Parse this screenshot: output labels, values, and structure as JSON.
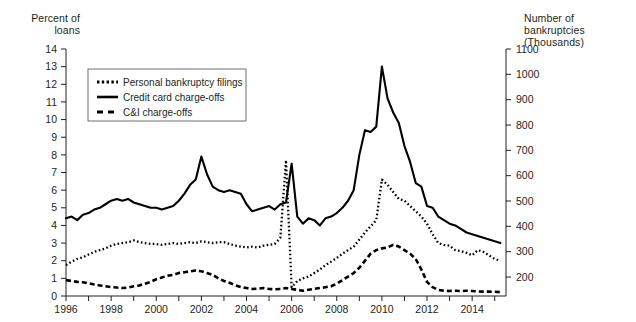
{
  "figure": {
    "left_axis_title": "Percent of\nloans",
    "right_axis_title": "Number of bankruptcies\n(Thousands)",
    "clipped_header": ""
  },
  "legend": {
    "items": [
      {
        "label": "Personal bankruptcy filings",
        "style": "dotted"
      },
      {
        "label": "Credit card charge-offs",
        "style": "solid"
      },
      {
        "label": "C&I charge-offs",
        "style": "dashed"
      }
    ]
  },
  "chart_data": {
    "type": "line",
    "title": "",
    "xlabel": "",
    "ylabel": "Percent of loans",
    "y2label": "Number of bankruptcies (Thousands)",
    "xlim": [
      1996.0,
      2015.5
    ],
    "ylim": [
      0,
      14
    ],
    "y2lim": [
      125,
      1100
    ],
    "grid": false,
    "legend_position": "upper-left-inset",
    "x_ticks": [
      1996,
      1997,
      1998,
      1999,
      2000,
      2001,
      2002,
      2003,
      2004,
      2005,
      2006,
      2007,
      2008,
      2009,
      2010,
      2011,
      2012,
      2013,
      2014,
      2015
    ],
    "x_tick_labels": [
      "1996",
      "",
      "1998",
      "",
      "2000",
      "",
      "2002",
      "",
      "2004",
      "",
      "2006",
      "",
      "2008",
      "",
      "2010",
      "",
      "2012",
      "",
      "2014",
      ""
    ],
    "y_ticks": [
      0,
      1,
      2,
      3,
      4,
      5,
      6,
      7,
      8,
      9,
      10,
      11,
      12,
      13,
      14
    ],
    "y_tick_labels": [
      "0",
      "1",
      "2",
      "3",
      "4",
      "5",
      "6",
      "7",
      "8",
      "9",
      "10",
      "11",
      "12",
      "13",
      "14"
    ],
    "y2_ticks": [
      200,
      300,
      400,
      500,
      600,
      700,
      800,
      900,
      1000,
      1100
    ],
    "y2_tick_labels": [
      "200",
      "300",
      "400",
      "500",
      "600",
      "700",
      "800",
      "900",
      "1000",
      "1100"
    ],
    "series": [
      {
        "name": "Credit card charge-offs",
        "style": "solid",
        "axis": "left",
        "x": [
          1996.0,
          1996.25,
          1996.5,
          1996.75,
          1997.0,
          1997.25,
          1997.5,
          1997.75,
          1998.0,
          1998.25,
          1998.5,
          1998.75,
          1999.0,
          1999.25,
          1999.5,
          1999.75,
          2000.0,
          2000.25,
          2000.5,
          2000.75,
          2001.0,
          2001.25,
          2001.5,
          2001.75,
          2002.0,
          2002.25,
          2002.5,
          2002.75,
          2003.0,
          2003.25,
          2003.5,
          2003.75,
          2004.0,
          2004.25,
          2004.5,
          2004.75,
          2005.0,
          2005.25,
          2005.5,
          2005.75,
          2006.0,
          2006.25,
          2006.5,
          2006.75,
          2007.0,
          2007.25,
          2007.5,
          2007.75,
          2008.0,
          2008.25,
          2008.5,
          2008.75,
          2009.0,
          2009.25,
          2009.5,
          2009.75,
          2010.0,
          2010.25,
          2010.5,
          2010.75,
          2011.0,
          2011.25,
          2011.5,
          2011.75,
          2012.0,
          2012.25,
          2012.5,
          2012.75,
          2013.0,
          2013.25,
          2013.5,
          2013.75,
          2014.0,
          2014.25,
          2014.5,
          2014.75,
          2015.0,
          2015.25
        ],
        "values": [
          4.4,
          4.5,
          4.3,
          4.6,
          4.7,
          4.9,
          5.0,
          5.2,
          5.4,
          5.5,
          5.4,
          5.5,
          5.3,
          5.2,
          5.1,
          5.0,
          5.0,
          4.9,
          5.0,
          5.1,
          5.4,
          5.8,
          6.3,
          6.6,
          7.9,
          6.9,
          6.2,
          6.0,
          5.9,
          6.0,
          5.9,
          5.8,
          5.2,
          4.8,
          4.9,
          5.0,
          5.1,
          4.9,
          5.2,
          5.3,
          7.5,
          4.5,
          4.1,
          4.4,
          4.3,
          4.0,
          4.4,
          4.5,
          4.7,
          5.0,
          5.4,
          6.0,
          8.0,
          9.4,
          9.3,
          9.6,
          13.0,
          11.2,
          10.4,
          9.8,
          8.5,
          7.6,
          6.4,
          6.2,
          5.1,
          5.0,
          4.5,
          4.3,
          4.1,
          4.0,
          3.8,
          3.6,
          3.5,
          3.4,
          3.3,
          3.2,
          3.1,
          3.0
        ]
      },
      {
        "name": "Personal bankruptcy filings",
        "style": "dotted",
        "axis": "right",
        "x": [
          1996.0,
          1996.25,
          1996.5,
          1996.75,
          1997.0,
          1997.25,
          1997.5,
          1997.75,
          1998.0,
          1998.25,
          1998.5,
          1998.75,
          1999.0,
          1999.25,
          1999.5,
          1999.75,
          2000.0,
          2000.25,
          2000.5,
          2000.75,
          2001.0,
          2001.25,
          2001.5,
          2001.75,
          2002.0,
          2002.25,
          2002.5,
          2002.75,
          2003.0,
          2003.25,
          2003.5,
          2003.75,
          2004.0,
          2004.25,
          2004.5,
          2004.75,
          2005.0,
          2005.25,
          2005.5,
          2005.75,
          2006.0,
          2006.25,
          2006.5,
          2006.75,
          2007.0,
          2007.25,
          2007.5,
          2007.75,
          2008.0,
          2008.25,
          2008.5,
          2008.75,
          2009.0,
          2009.25,
          2009.5,
          2009.75,
          2010.0,
          2010.25,
          2010.5,
          2010.75,
          2011.0,
          2011.25,
          2011.5,
          2011.75,
          2012.0,
          2012.25,
          2012.5,
          2012.75,
          2013.0,
          2013.25,
          2013.5,
          2013.75,
          2014.0,
          2014.25,
          2014.5,
          2014.75,
          2015.0,
          2015.25
        ],
        "values": [
          1.75,
          1.95,
          2.1,
          2.2,
          2.35,
          2.5,
          2.6,
          2.7,
          2.85,
          2.95,
          3.0,
          3.05,
          3.15,
          3.05,
          3.0,
          2.95,
          2.95,
          2.9,
          2.95,
          3.0,
          2.95,
          3.0,
          3.05,
          3.0,
          3.1,
          3.05,
          3.0,
          3.05,
          3.05,
          2.95,
          2.85,
          2.8,
          2.75,
          2.8,
          2.75,
          2.85,
          2.9,
          2.95,
          3.3,
          7.7,
          0.5,
          0.85,
          1.0,
          1.1,
          1.3,
          1.5,
          1.75,
          1.95,
          2.15,
          2.4,
          2.6,
          2.8,
          3.2,
          3.6,
          3.95,
          4.3,
          6.6,
          6.3,
          5.9,
          5.5,
          5.4,
          5.1,
          4.8,
          4.5,
          4.1,
          3.5,
          3.0,
          2.9,
          2.85,
          2.6,
          2.55,
          2.45,
          2.3,
          2.6,
          2.5,
          2.3,
          2.1,
          2.0
        ]
      },
      {
        "name": "C&I charge-offs",
        "style": "dashed",
        "axis": "left",
        "x": [
          1996.0,
          1996.25,
          1996.5,
          1996.75,
          1997.0,
          1997.25,
          1997.5,
          1997.75,
          1998.0,
          1998.25,
          1998.5,
          1998.75,
          1999.0,
          1999.25,
          1999.5,
          1999.75,
          2000.0,
          2000.25,
          2000.5,
          2000.75,
          2001.0,
          2001.25,
          2001.5,
          2001.75,
          2002.0,
          2002.25,
          2002.5,
          2002.75,
          2003.0,
          2003.25,
          2003.5,
          2003.75,
          2004.0,
          2004.25,
          2004.5,
          2004.75,
          2005.0,
          2005.25,
          2005.5,
          2005.75,
          2006.0,
          2006.25,
          2006.5,
          2006.75,
          2007.0,
          2007.25,
          2007.5,
          2007.75,
          2008.0,
          2008.25,
          2008.5,
          2008.75,
          2009.0,
          2009.25,
          2009.5,
          2009.75,
          2010.0,
          2010.25,
          2010.5,
          2010.75,
          2011.0,
          2011.25,
          2011.5,
          2011.75,
          2012.0,
          2012.25,
          2012.5,
          2012.75,
          2013.0,
          2013.25,
          2013.5,
          2013.75,
          2014.0,
          2014.25,
          2014.5,
          2014.75,
          2015.0,
          2015.25
        ],
        "values": [
          0.9,
          0.85,
          0.8,
          0.78,
          0.72,
          0.65,
          0.6,
          0.55,
          0.5,
          0.48,
          0.45,
          0.48,
          0.55,
          0.6,
          0.7,
          0.8,
          0.95,
          1.05,
          1.15,
          1.2,
          1.3,
          1.35,
          1.4,
          1.45,
          1.4,
          1.3,
          1.2,
          1.0,
          0.85,
          0.75,
          0.6,
          0.5,
          0.45,
          0.4,
          0.42,
          0.45,
          0.4,
          0.38,
          0.4,
          0.45,
          0.4,
          0.35,
          0.3,
          0.35,
          0.4,
          0.45,
          0.5,
          0.55,
          0.7,
          0.9,
          1.1,
          1.3,
          1.6,
          2.0,
          2.4,
          2.6,
          2.7,
          2.75,
          2.9,
          2.8,
          2.6,
          2.4,
          2.1,
          1.5,
          0.8,
          0.5,
          0.35,
          0.3,
          0.28,
          0.3,
          0.28,
          0.3,
          0.28,
          0.26,
          0.25,
          0.25,
          0.24,
          0.22
        ]
      }
    ]
  }
}
